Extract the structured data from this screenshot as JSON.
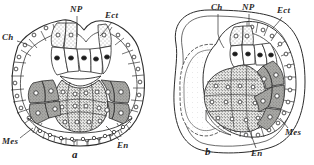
{
  "figure": {
    "background_color": "#ffffff",
    "ink_color": "#2b2b2b"
  },
  "panels": [
    {
      "caption": "a",
      "caption_pos": {
        "x": 72,
        "y": 149
      },
      "labels": [
        {
          "key": "np",
          "text": "NP",
          "x": 70,
          "y": 5,
          "leader": [
            [
              77,
              16
            ],
            [
              77,
              37
            ]
          ]
        },
        {
          "key": "ect",
          "text": "Ect",
          "x": 105,
          "y": 11,
          "leader": [
            [
              112,
              22
            ],
            [
              100,
              36
            ]
          ]
        },
        {
          "key": "ch",
          "text": "Ch",
          "x": 2,
          "y": 33,
          "leader": [
            [
              17,
              41
            ],
            [
              32,
              47
            ]
          ]
        },
        {
          "key": "mes",
          "text": "Mes",
          "x": 2,
          "y": 137,
          "leader": [
            [
              20,
              138
            ],
            [
              33,
              128
            ]
          ]
        },
        {
          "key": "en",
          "text": "En",
          "x": 118,
          "y": 141,
          "leader": [
            [
              119,
              140
            ],
            [
              106,
              126
            ]
          ]
        }
      ]
    },
    {
      "caption": "b",
      "caption_pos": {
        "x": 205,
        "y": 146
      },
      "labels": [
        {
          "key": "ch",
          "text": "Ch",
          "x": 211,
          "y": 3,
          "leader": [
            [
              218,
              14
            ],
            [
              224,
              48
            ]
          ]
        },
        {
          "key": "np",
          "text": "NP",
          "x": 243,
          "y": 3,
          "leader": [
            [
              249,
              14
            ],
            [
              249,
              26
            ]
          ]
        },
        {
          "key": "ect",
          "text": "Ect",
          "x": 277,
          "y": 6,
          "leader": [
            [
              282,
              17
            ],
            [
              272,
              29
            ]
          ]
        },
        {
          "key": "mes",
          "text": "Mes",
          "x": 285,
          "y": 128,
          "leader": [
            [
              288,
              128
            ],
            [
              280,
              118
            ]
          ]
        },
        {
          "key": "en",
          "text": "En",
          "x": 252,
          "y": 149,
          "leader": [
            [
              256,
              148
            ],
            [
              248,
              127
            ]
          ]
        }
      ]
    }
  ],
  "legend_keys": [
    {
      "abbr": "NP",
      "meaning": "neural plate"
    },
    {
      "abbr": "Ect",
      "meaning": "ectoderm"
    },
    {
      "abbr": "Ch",
      "meaning": "chorda"
    },
    {
      "abbr": "Mes",
      "meaning": "mesoderm"
    },
    {
      "abbr": "En",
      "meaning": "endoderm"
    }
  ]
}
